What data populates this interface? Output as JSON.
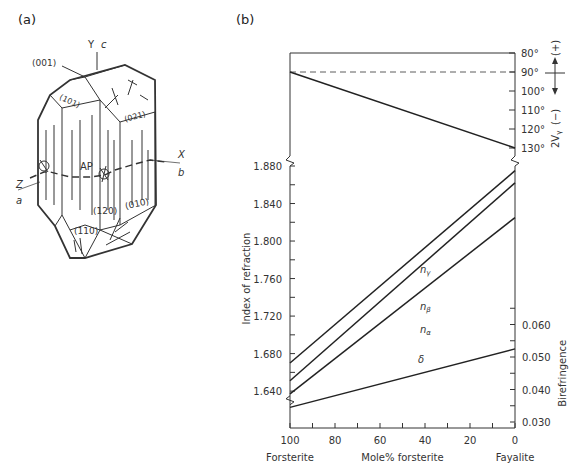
{
  "panel_a": {
    "label": "(a)",
    "axes": {
      "y": "Y",
      "c": "c",
      "x": "X",
      "b": "b",
      "z": "Z",
      "a": "a"
    },
    "faces": [
      "(001)",
      "(101)",
      "(021)",
      "(120)",
      "(010)",
      "(110)"
    ],
    "plane_label": "AP"
  },
  "panel_b": {
    "label": "(b)"
  },
  "chart_data": {
    "type": "line",
    "title": "",
    "xlabel": "Mole% forsterite",
    "x_end_labels": {
      "left": "Forsterite",
      "right": "Fayalite"
    },
    "x_ticks": [
      100,
      80,
      60,
      40,
      20,
      0
    ],
    "xlim": [
      100,
      0
    ],
    "top_panel": {
      "ylabel": "2Vγ",
      "sign_labels": {
        "positive": "(+)",
        "negative": "(−)"
      },
      "y_ticks": [
        "80°",
        "90°",
        "100°",
        "110°",
        "120°",
        "130°"
      ],
      "ylim": [
        80,
        130
      ],
      "reference_line": {
        "value": 90,
        "style": "dashed"
      },
      "series": [
        {
          "name": "2Vγ",
          "x": [
            100,
            0
          ],
          "values": [
            90,
            130
          ]
        }
      ]
    },
    "bottom_panel": {
      "ylabel_left": "Index of refraction",
      "y_ticks_left": [
        "1.640",
        "1.680",
        "1.720",
        "1.760",
        "1.800",
        "1.840",
        "1.880"
      ],
      "ylim_left": [
        1.62,
        1.89
      ],
      "ylabel_right": "Birefringence",
      "y_ticks_right": [
        "0.030",
        "0.040",
        "0.050",
        "0.060"
      ],
      "ylim_right": [
        0.03,
        0.06
      ],
      "series": [
        {
          "name": "nγ",
          "axis": "left",
          "x": [
            100,
            0
          ],
          "values": [
            1.67,
            1.875
          ]
        },
        {
          "name": "nβ",
          "axis": "left",
          "x": [
            100,
            0
          ],
          "values": [
            1.651,
            1.862
          ]
        },
        {
          "name": "nα",
          "axis": "left",
          "x": [
            100,
            0
          ],
          "values": [
            1.637,
            1.825
          ]
        },
        {
          "name": "δ",
          "axis": "right",
          "x": [
            100,
            0
          ],
          "values": [
            0.0345,
            0.0525
          ]
        }
      ]
    }
  }
}
